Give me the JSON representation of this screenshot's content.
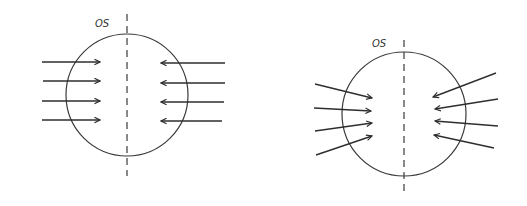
{
  "diagrams": [
    {
      "id": "left",
      "label": "OS",
      "circle": {
        "cx": 127,
        "cy": 95,
        "r": 61
      },
      "axis": {
        "x": 127,
        "y1": 14,
        "y2": 176
      },
      "label_pos": {
        "x": 95,
        "y": 27
      },
      "arrows": [
        {
          "x1": 42,
          "y1": 62,
          "x2": 100,
          "y2": 62
        },
        {
          "x1": 43,
          "y1": 81,
          "x2": 100,
          "y2": 81
        },
        {
          "x1": 42,
          "y1": 101,
          "x2": 100,
          "y2": 101
        },
        {
          "x1": 42,
          "y1": 120,
          "x2": 100,
          "y2": 120
        },
        {
          "x1": 225,
          "y1": 63,
          "x2": 161,
          "y2": 63
        },
        {
          "x1": 225,
          "y1": 83,
          "x2": 161,
          "y2": 83
        },
        {
          "x1": 224,
          "y1": 102,
          "x2": 161,
          "y2": 102
        },
        {
          "x1": 222,
          "y1": 121,
          "x2": 161,
          "y2": 121
        }
      ],
      "description": "Parallel horizontal arrows converging from both sides toward vertical dashed midline"
    },
    {
      "id": "right",
      "label": "OS",
      "circle": {
        "cx": 404,
        "cy": 114,
        "r": 62
      },
      "axis": {
        "x": 404,
        "y1": 40,
        "y2": 193
      },
      "label_pos": {
        "x": 372,
        "y": 47
      },
      "arrows": [
        {
          "x1": 315,
          "y1": 84,
          "x2": 372,
          "y2": 98
        },
        {
          "x1": 314,
          "y1": 108,
          "x2": 371,
          "y2": 111
        },
        {
          "x1": 315,
          "y1": 131,
          "x2": 372,
          "y2": 123
        },
        {
          "x1": 316,
          "y1": 155,
          "x2": 372,
          "y2": 136
        },
        {
          "x1": 496,
          "y1": 73,
          "x2": 433,
          "y2": 97
        },
        {
          "x1": 498,
          "y1": 99,
          "x2": 435,
          "y2": 109
        },
        {
          "x1": 498,
          "y1": 126,
          "x2": 435,
          "y2": 121
        },
        {
          "x1": 494,
          "y1": 148,
          "x2": 434,
          "y2": 135
        }
      ],
      "description": "Slanted arrows converging from both sides toward vertical dashed midline"
    }
  ]
}
